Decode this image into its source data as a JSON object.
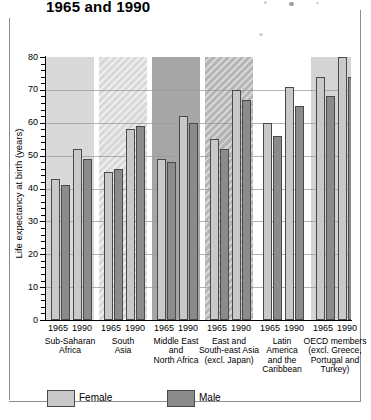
{
  "chart_data": {
    "type": "bar",
    "title": "1965 and 1990",
    "xlabel": "",
    "ylabel": "Life expectancy at birth (years)",
    "ylim": [
      0,
      80
    ],
    "ytick_step": 10,
    "yticks": [
      0,
      10,
      20,
      30,
      40,
      50,
      60,
      70,
      80
    ],
    "minor_tick_step": 2,
    "grid": true,
    "legend_position": "bottom-left",
    "categories": [
      "Sub-Saharan Africa",
      "South Asia",
      "Middle East and North Africa",
      "East and South-east Asia (excl. Japan)",
      "Latin America and the Caribbean",
      "OECD members (excl. Greece, Portugal and Turkey)"
    ],
    "subgroups": [
      "1965",
      "1990"
    ],
    "series": [
      {
        "name": "Female",
        "color": "#c9c9c9",
        "values_1965": [
          43,
          45,
          49,
          55,
          60,
          74
        ],
        "values_1990": [
          52,
          58,
          62,
          70,
          71,
          80
        ]
      },
      {
        "name": "Male",
        "color": "#8b8b8b",
        "values_1965": [
          41,
          46,
          48,
          52,
          56,
          68
        ],
        "values_1990": [
          49,
          59,
          60,
          67,
          65,
          74
        ]
      }
    ]
  },
  "axis": {
    "y_title": "Life expectancy at birth (years)",
    "y_labels": [
      "80",
      "70",
      "60",
      "50",
      "40",
      "30",
      "20",
      "10",
      "0"
    ]
  },
  "groups": [
    {
      "lines": [
        "Sub-Saharan",
        "Africa"
      ],
      "years": [
        "1965",
        "1990"
      ],
      "female_1965": 43,
      "male_1965": 41,
      "female_1990": 52,
      "male_1990": 49
    },
    {
      "lines": [
        "South",
        "Asia"
      ],
      "years": [
        "1965",
        "1990"
      ],
      "female_1965": 45,
      "male_1965": 46,
      "female_1990": 58,
      "male_1990": 59
    },
    {
      "lines": [
        "Middle East",
        "and",
        "North Africa"
      ],
      "years": [
        "1965",
        "1990"
      ],
      "female_1965": 49,
      "male_1965": 48,
      "female_1990": 62,
      "male_1990": 60
    },
    {
      "lines": [
        "East and",
        "South-east Asia",
        "(excl. Japan)"
      ],
      "years": [
        "1965",
        "1990"
      ],
      "female_1965": 55,
      "male_1965": 52,
      "female_1990": 70,
      "male_1990": 67
    },
    {
      "lines": [
        "Latin",
        "America",
        "and the",
        "Caribbean"
      ],
      "years": [
        "1965",
        "1990"
      ],
      "female_1965": 60,
      "male_1965": 56,
      "female_1990": 71,
      "male_1990": 65
    },
    {
      "lines": [
        "OECD members",
        "(excl. Greece,",
        "Portugal and",
        "Turkey)"
      ],
      "years": [
        "1965",
        "1990"
      ],
      "female_1965": 74,
      "male_1965": 68,
      "female_1990": 80,
      "male_1990": 74
    }
  ],
  "legend": {
    "female_label": "Female",
    "male_label": "Male"
  },
  "colors": {
    "female": "#c9c9c9",
    "male": "#8b8b8b",
    "bar_outline": "#4a4a4a",
    "axis": "#000000",
    "grid": "#9a9a9a"
  }
}
